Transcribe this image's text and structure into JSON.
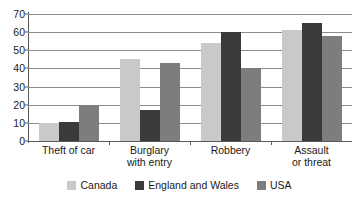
{
  "chart_data": {
    "type": "bar",
    "title": "",
    "subtitle": "",
    "xlabel": "",
    "ylabel": "",
    "ylim": [
      0,
      70
    ],
    "yticks": [
      0,
      10,
      20,
      30,
      40,
      50,
      60,
      70
    ],
    "ytick_labels": [
      "0",
      "10",
      "20",
      "30",
      "40",
      "50",
      "60",
      "70"
    ],
    "grid": true,
    "legend_position": "bottom",
    "categories": [
      "Theft of car",
      "Burglary\nwith entry",
      "Robbery",
      "Assault\nor threat"
    ],
    "series": [
      {
        "name": "Canada",
        "color": "#c9c9c9",
        "values": [
          10,
          45,
          54,
          61
        ]
      },
      {
        "name": "England and Wales",
        "color": "#3a3a3a",
        "values": [
          10.5,
          17,
          60,
          65
        ]
      },
      {
        "name": "USA",
        "color": "#7d7d7d",
        "values": [
          20,
          43,
          40,
          58
        ]
      }
    ]
  },
  "legend": {
    "items": [
      {
        "label": "Canada",
        "color": "#c9c9c9"
      },
      {
        "label": "England and Wales",
        "color": "#3a3a3a"
      },
      {
        "label": "USA",
        "color": "#7d7d7d"
      }
    ]
  },
  "axis": {
    "axis_color": "#5a5a5a",
    "gridline_color": "#8c8c8c"
  }
}
